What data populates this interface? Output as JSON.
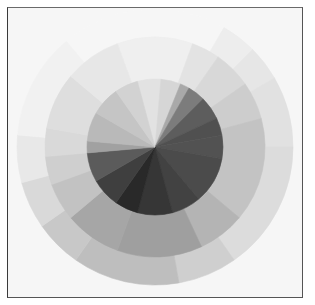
{
  "artwork": {
    "subject": "grayscale color circle",
    "center": [
      155,
      147
    ],
    "background": "#f6f6f6",
    "frame_color": "#555555",
    "rings": [
      {
        "name": "outer-ring",
        "radius": 138,
        "sectors": [
          {
            "start": 320,
            "end": 390,
            "color": "#f6f6f6"
          },
          {
            "start": 30,
            "end": 45,
            "color": "#ededed"
          },
          {
            "start": 45,
            "end": 60,
            "color": "#e6e6e6"
          },
          {
            "start": 60,
            "end": 90,
            "color": "#e1e1e1"
          },
          {
            "start": 90,
            "end": 145,
            "color": "#dcdcdc"
          },
          {
            "start": 145,
            "end": 170,
            "color": "#cfcfcf"
          },
          {
            "start": 170,
            "end": 215,
            "color": "#bebebe"
          },
          {
            "start": 215,
            "end": 235,
            "color": "#c8c8c8"
          },
          {
            "start": 235,
            "end": 255,
            "color": "#d9d9d9"
          },
          {
            "start": 255,
            "end": 275,
            "color": "#e8e8e8"
          },
          {
            "start": 275,
            "end": 320,
            "color": "#f1f1f1"
          }
        ]
      },
      {
        "name": "middle-ring",
        "radius": 110,
        "sectors": [
          {
            "start": 340,
            "end": 380,
            "color": "#efefef"
          },
          {
            "start": 20,
            "end": 35,
            "color": "#e3e3e3"
          },
          {
            "start": 35,
            "end": 55,
            "color": "#d8d8d8"
          },
          {
            "start": 55,
            "end": 75,
            "color": "#cdcdcd"
          },
          {
            "start": 75,
            "end": 130,
            "color": "#c3c3c3"
          },
          {
            "start": 130,
            "end": 155,
            "color": "#b4b4b4"
          },
          {
            "start": 155,
            "end": 200,
            "color": "#9f9f9f"
          },
          {
            "start": 200,
            "end": 230,
            "color": "#a6a6a6"
          },
          {
            "start": 230,
            "end": 250,
            "color": "#c2c2c2"
          },
          {
            "start": 250,
            "end": 265,
            "color": "#cfcfcf"
          },
          {
            "start": 265,
            "end": 280,
            "color": "#d9d9d9"
          },
          {
            "start": 280,
            "end": 310,
            "color": "#dedede"
          },
          {
            "start": 310,
            "end": 340,
            "color": "#e7e7e7"
          }
        ]
      },
      {
        "name": "inner-circle",
        "radius": 68,
        "sectors": [
          {
            "start": 345,
            "end": 365,
            "color": "#e2e2e2"
          },
          {
            "start": 5,
            "end": 22,
            "color": "#d6d6d6"
          },
          {
            "start": 22,
            "end": 30,
            "color": "#a9a9a9"
          },
          {
            "start": 30,
            "end": 45,
            "color": "#7c7c7c"
          },
          {
            "start": 45,
            "end": 65,
            "color": "#5d5d5d"
          },
          {
            "start": 65,
            "end": 80,
            "color": "#505050"
          },
          {
            "start": 80,
            "end": 100,
            "color": "#525252"
          },
          {
            "start": 100,
            "end": 140,
            "color": "#4b4b4b"
          },
          {
            "start": 140,
            "end": 165,
            "color": "#424242"
          },
          {
            "start": 165,
            "end": 195,
            "color": "#363636"
          },
          {
            "start": 195,
            "end": 215,
            "color": "#292929"
          },
          {
            "start": 215,
            "end": 240,
            "color": "#3f3f3f"
          },
          {
            "start": 240,
            "end": 265,
            "color": "#5b5b5b"
          },
          {
            "start": 265,
            "end": 275,
            "color": "#a1a1a1"
          },
          {
            "start": 275,
            "end": 300,
            "color": "#b9b9b9"
          },
          {
            "start": 300,
            "end": 325,
            "color": "#c5c5c5"
          },
          {
            "start": 325,
            "end": 345,
            "color": "#d2d2d2"
          }
        ]
      }
    ]
  }
}
